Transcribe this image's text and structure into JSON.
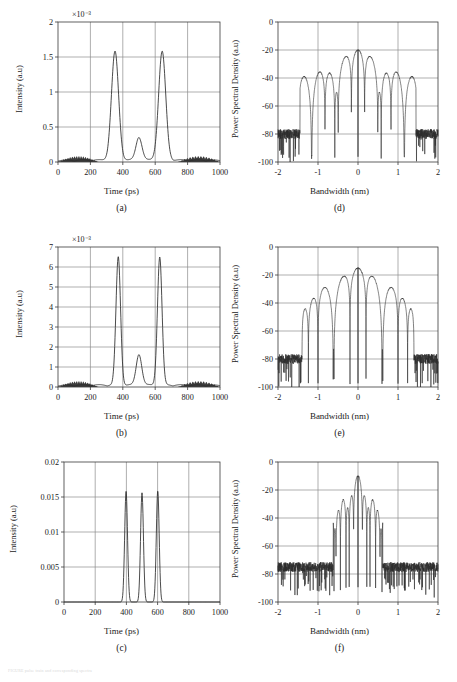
{
  "figure": {
    "caption_faint": "FIGURE  pulse train and corresponding spectra",
    "panel_labels": [
      "(a)",
      "(b)",
      "(c)",
      "(d)",
      "(e)",
      "(f)"
    ]
  },
  "axes": {
    "time": {
      "label": "Time (ps)",
      "ticks": [
        0,
        200,
        400,
        600,
        800,
        1000
      ],
      "tick_labels": [
        "0",
        "200",
        "400",
        "600",
        "800",
        "1000"
      ],
      "range": [
        0,
        1000
      ]
    },
    "bandwidth": {
      "label": "Bandwidth (nm)",
      "ticks": [
        -2,
        -1,
        0,
        1,
        2
      ],
      "tick_labels": [
        "-2",
        "-1",
        "0",
        "1",
        "2"
      ],
      "range": [
        -2,
        2
      ]
    },
    "intensity": {
      "label": "Intensity (a.u)"
    },
    "psd": {
      "label": "Power Spectral Density (a.u)",
      "ticks": [
        0,
        -20,
        -40,
        -60,
        -80,
        -100
      ],
      "tick_labels": [
        "0",
        "-20",
        "-40",
        "-60",
        "-80",
        "-100"
      ],
      "range": [
        -100,
        0
      ]
    }
  },
  "chart_data": [
    {
      "id": "a",
      "panel_label": "(a)",
      "type": "line",
      "title": "",
      "xlabel": "Time (ps)",
      "ylabel": "Intensity (a.u)",
      "xlim": [
        0,
        1000
      ],
      "ylim": [
        0,
        2
      ],
      "y_exponent": "×10⁻³",
      "y_ticks": [
        0,
        0.5,
        1,
        1.5,
        2
      ],
      "y_tick_labels": [
        "0",
        "0.5",
        "1",
        "1.5",
        "2"
      ],
      "grid": true,
      "noise_pedestal": true,
      "peaks": [
        {
          "center": 352,
          "amplitude": 1.55,
          "width": 62
        },
        {
          "center": 500,
          "amplitude": 0.33,
          "width": 52
        },
        {
          "center": 643,
          "amplitude": 1.55,
          "width": 62
        }
      ],
      "x": [
        0,
        50,
        100,
        150,
        200,
        250,
        280,
        300,
        320,
        340,
        352,
        365,
        385,
        405,
        425,
        445,
        465,
        485,
        500,
        515,
        535,
        555,
        575,
        595,
        615,
        631,
        643,
        655,
        675,
        695,
        715,
        740,
        760,
        800,
        850,
        900,
        950,
        1000
      ],
      "values": [
        0.03,
        0.04,
        0.03,
        0.02,
        0.03,
        0.02,
        0.06,
        0.22,
        0.72,
        1.35,
        1.55,
        1.47,
        1.0,
        0.42,
        0.07,
        0.11,
        0.26,
        0.32,
        0.33,
        0.31,
        0.22,
        0.09,
        0.05,
        0.3,
        1.05,
        1.5,
        1.55,
        1.44,
        0.92,
        0.36,
        0.1,
        0.03,
        0.02,
        0.03,
        0.04,
        0.03,
        0.04,
        0.05
      ]
    },
    {
      "id": "b",
      "panel_label": "(b)",
      "type": "line",
      "title": "",
      "xlabel": "Time (ps)",
      "ylabel": "Intensity (a.u)",
      "xlim": [
        0,
        1000
      ],
      "ylim": [
        0,
        7
      ],
      "y_exponent": "×10⁻³",
      "y_ticks": [
        0,
        1,
        2,
        3,
        4,
        5,
        6,
        7
      ],
      "y_tick_labels": [
        "0",
        "1",
        "2",
        "3",
        "4",
        "5",
        "6",
        "7"
      ],
      "grid": true,
      "noise_pedestal": true,
      "peaks": [
        {
          "center": 372,
          "amplitude": 6.4,
          "width": 40
        },
        {
          "center": 500,
          "amplitude": 1.55,
          "width": 48
        },
        {
          "center": 628,
          "amplitude": 6.4,
          "width": 40
        }
      ],
      "x": [
        0,
        60,
        120,
        180,
        240,
        280,
        310,
        330,
        350,
        362,
        372,
        382,
        394,
        410,
        428,
        445,
        465,
        485,
        500,
        515,
        535,
        555,
        572,
        590,
        608,
        620,
        628,
        638,
        650,
        666,
        685,
        705,
        730,
        770,
        820,
        880,
        940,
        1000
      ],
      "values": [
        0.05,
        0.06,
        0.05,
        0.04,
        0.05,
        0.12,
        0.55,
        1.7,
        4.6,
        6.0,
        6.4,
        6.1,
        5.0,
        2.9,
        1.0,
        0.5,
        1.15,
        1.5,
        1.55,
        1.5,
        1.1,
        0.48,
        0.75,
        2.6,
        5.5,
        6.25,
        6.4,
        6.0,
        4.6,
        2.1,
        0.6,
        0.15,
        0.06,
        0.05,
        0.06,
        0.05,
        0.06,
        0.07
      ]
    },
    {
      "id": "c",
      "panel_label": "(c)",
      "type": "line",
      "title": "",
      "xlabel": "Time (ps)",
      "ylabel": "Intensity (a.u)",
      "xlim": [
        0,
        1000
      ],
      "ylim": [
        0,
        0.02
      ],
      "y_exponent": "",
      "y_ticks": [
        0,
        0.005,
        0.01,
        0.015,
        0.02
      ],
      "y_tick_labels": [
        "0",
        "0.005",
        "0.01",
        "0.015",
        "0.02"
      ],
      "grid": true,
      "noise_pedestal": false,
      "peaks": [
        {
          "center": 398,
          "amplitude": 0.0158,
          "width": 26
        },
        {
          "center": 500,
          "amplitude": 0.0156,
          "width": 26
        },
        {
          "center": 601,
          "amplitude": 0.0159,
          "width": 26
        }
      ],
      "x": [
        0,
        100,
        200,
        280,
        320,
        350,
        370,
        385,
        398,
        412,
        428,
        442,
        452,
        462,
        478,
        492,
        500,
        510,
        524,
        540,
        552,
        562,
        578,
        592,
        601,
        614,
        628,
        644,
        660,
        690,
        730,
        800,
        900,
        1000
      ],
      "values": [
        0,
        0,
        0,
        0.0002,
        0.0012,
        0.0048,
        0.0108,
        0.0148,
        0.0158,
        0.0142,
        0.0078,
        0.0018,
        0.0004,
        0.0018,
        0.0085,
        0.0145,
        0.0156,
        0.0146,
        0.009,
        0.0022,
        0.0004,
        0.0016,
        0.0082,
        0.0146,
        0.0159,
        0.0144,
        0.0082,
        0.0018,
        0.0004,
        0.0001,
        0,
        0,
        0,
        0
      ]
    },
    {
      "id": "d",
      "panel_label": "(d)",
      "type": "line",
      "title": "",
      "xlabel": "Bandwidth (nm)",
      "ylabel": "Power Spectral Density (a.u)",
      "xlim": [
        -2,
        2
      ],
      "ylim": [
        -100,
        0
      ],
      "y_ticks": [
        0,
        -20,
        -40,
        -60,
        -80,
        -100
      ],
      "y_tick_labels": [
        "0",
        "-20",
        "-40",
        "-60",
        "-80",
        "-100"
      ],
      "grid": true,
      "main_peak_db": -20,
      "main_peak_positions": [
        -0.16,
        0.16
      ],
      "sidelobe_peaks_db": [
        -37,
        -53,
        -66
      ],
      "noise_floor_db": -80,
      "noise_span": [
        [
          -2.0,
          -1.45
        ],
        [
          1.45,
          2.0
        ]
      ],
      "lobe_spacing_nm": 0.33
    },
    {
      "id": "e",
      "panel_label": "(e)",
      "type": "line",
      "title": "",
      "xlabel": "Bandwidth (nm)",
      "ylabel": "Power Spectral Density (a.u)",
      "xlim": [
        -2,
        2
      ],
      "ylim": [
        -100,
        0
      ],
      "y_ticks": [
        0,
        -20,
        -40,
        -60,
        -80,
        -100
      ],
      "y_tick_labels": [
        "0",
        "-20",
        "-40",
        "-60",
        "-80",
        "-100"
      ],
      "grid": true,
      "main_peak_db": -15,
      "main_peak_positions": [
        -0.15,
        0.15
      ],
      "sidelobe_peaks_db": [
        -35,
        -53,
        -65
      ],
      "noise_floor_db": -80,
      "noise_span": [
        [
          -2.0,
          -1.4
        ],
        [
          1.4,
          2.0
        ]
      ],
      "lobe_spacing_nm": 0.4
    },
    {
      "id": "f",
      "panel_label": "(f)",
      "type": "line",
      "title": "",
      "xlabel": "Bandwidth (nm)",
      "ylabel": "Power Spectral Density (a.u)",
      "xlim": [
        -2,
        2
      ],
      "ylim": [
        -100,
        0
      ],
      "y_ticks": [
        0,
        -20,
        -40,
        -60,
        -80,
        -100
      ],
      "y_tick_labels": [
        "0",
        "-20",
        "-40",
        "-60",
        "-80",
        "-100"
      ],
      "grid": true,
      "main_peak_db": -10,
      "main_peak_positions": [
        -0.1,
        0.0,
        0.1
      ],
      "sidelobe_peaks_db": [
        -50
      ],
      "sidelobe_positions": [
        -0.4,
        0.4
      ],
      "noise_floor_db": -75,
      "noise_span": [
        [
          -2.0,
          -0.62
        ],
        [
          0.62,
          2.0
        ]
      ],
      "lobe_spacing_nm": 0.33
    }
  ]
}
